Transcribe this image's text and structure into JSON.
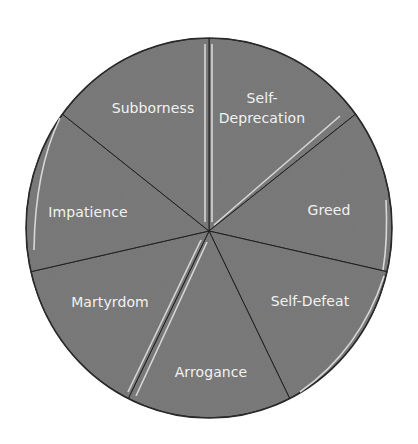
{
  "chart_data": {
    "type": "pie",
    "title": "",
    "categories": [
      "Self-Deprecation",
      "Greed",
      "Self-Defeat",
      "Arrogance",
      "Martyrdom",
      "Impatience",
      "Subborness"
    ],
    "values": [
      1,
      1,
      1,
      1,
      1,
      1,
      1
    ],
    "percent": [
      14.3,
      14.3,
      14.3,
      14.3,
      14.3,
      14.3,
      14.3
    ],
    "start_angle_deg": 0,
    "direction": "clockwise",
    "legend": "none (labels inside slices)",
    "colors": {
      "slice_fill": "#7b7b7b",
      "label_text": "#f2f2f2",
      "outline": "#1e1e1e"
    }
  },
  "labels": [
    {
      "id": "self-deprecation",
      "lines": [
        "Self-",
        "Deprecation"
      ],
      "x": 262,
      "y": 108
    },
    {
      "id": "greed",
      "lines": [
        "Greed"
      ],
      "x": 329,
      "y": 210
    },
    {
      "id": "self-defeat",
      "lines": [
        "Self-Defeat"
      ],
      "x": 310,
      "y": 301
    },
    {
      "id": "arrogance",
      "lines": [
        "Arrogance"
      ],
      "x": 211,
      "y": 372
    },
    {
      "id": "martyrdom",
      "lines": [
        "Martyrdom"
      ],
      "x": 110,
      "y": 302
    },
    {
      "id": "impatience",
      "lines": [
        "Impatience"
      ],
      "x": 88,
      "y": 212
    },
    {
      "id": "subborness",
      "lines": [
        "Subborness"
      ],
      "x": 153,
      "y": 108
    }
  ]
}
